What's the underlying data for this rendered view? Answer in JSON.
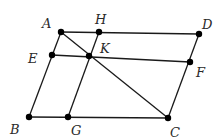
{
  "diagram": {
    "type": "geometry-parallelogram",
    "stroke_color": "#1a1a1a",
    "points": {
      "A": {
        "label": "A",
        "x": 61,
        "y": 32,
        "lx": 42,
        "ly": 28
      },
      "H": {
        "label": "H",
        "x": 99,
        "y": 32,
        "lx": 95,
        "ly": 24
      },
      "D": {
        "label": "D",
        "x": 199,
        "y": 34,
        "lx": 202,
        "ly": 29
      },
      "E": {
        "label": "E",
        "x": 52,
        "y": 55,
        "lx": 28,
        "ly": 63
      },
      "K": {
        "label": "K",
        "x": 89,
        "y": 56,
        "lx": 100,
        "ly": 53
      },
      "F": {
        "label": "F",
        "x": 190,
        "y": 62,
        "lx": 196,
        "ly": 77
      },
      "B": {
        "label": "B",
        "x": 29,
        "y": 117,
        "lx": 10,
        "ly": 134
      },
      "G": {
        "label": "G",
        "x": 68,
        "y": 117,
        "lx": 71,
        "ly": 135
      },
      "C": {
        "label": "C",
        "x": 168,
        "y": 118,
        "lx": 170,
        "ly": 137
      }
    },
    "segments": [
      [
        "A",
        "D"
      ],
      [
        "D",
        "C"
      ],
      [
        "C",
        "B"
      ],
      [
        "B",
        "A"
      ],
      [
        "E",
        "F"
      ],
      [
        "H",
        "G"
      ],
      [
        "A",
        "C"
      ]
    ]
  }
}
